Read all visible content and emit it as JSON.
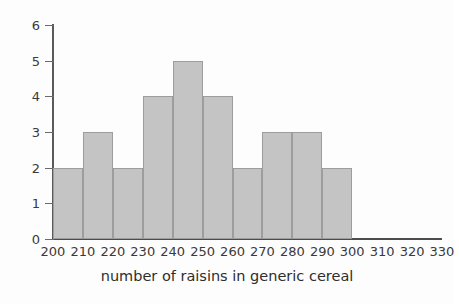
{
  "chart_data": {
    "type": "bar",
    "title": "",
    "xlabel": "number of raisins in generic cereal",
    "ylabel": "",
    "bin_width": 10,
    "bin_edges": [
      200,
      210,
      220,
      230,
      240,
      250,
      260,
      270,
      280,
      290,
      300
    ],
    "categories": [
      "200-210",
      "210-220",
      "220-230",
      "230-240",
      "240-250",
      "250-260",
      "260-270",
      "270-280",
      "280-290",
      "290-300"
    ],
    "values": [
      2,
      3,
      2,
      4,
      5,
      4,
      2,
      3,
      3,
      2
    ],
    "xlim": [
      200,
      330
    ],
    "ylim": [
      0,
      6
    ],
    "x_ticks": [
      200,
      210,
      220,
      230,
      240,
      250,
      260,
      270,
      280,
      290,
      300,
      310,
      320,
      330
    ],
    "y_ticks": [
      0,
      1,
      2,
      3,
      4,
      5,
      6
    ],
    "x_tick_labels": [
      "200",
      "210",
      "220",
      "230",
      "240",
      "250",
      "260",
      "270",
      "280",
      "290",
      "300",
      "310",
      "320",
      "330"
    ],
    "y_tick_labels": [
      "0",
      "1",
      "2",
      "3",
      "4",
      "5",
      "6"
    ],
    "grid": false,
    "legend": null,
    "colors": {
      "bar_fill": "#c4c4c4",
      "bar_edge": "#9d9d9d",
      "axis": "#5a5a5a",
      "text": "#3a3a3a",
      "background": "#fdfdfd"
    }
  }
}
